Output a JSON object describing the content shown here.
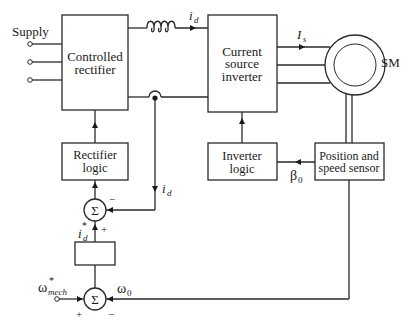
{
  "diagram": {
    "type": "block-diagram",
    "blocks": {
      "controlled_rectifier": {
        "line1": "Controlled",
        "line2": "rectifier"
      },
      "current_source_inverter": {
        "line1": "Current",
        "line2": "source",
        "line3": "inverter"
      },
      "rectifier_logic": {
        "line1": "Rectifier",
        "line2": "logic"
      },
      "inverter_logic": {
        "line1": "Inverter",
        "line2": "logic"
      },
      "position_speed_sensor": {
        "line1": "Position and",
        "line2": "speed sensor"
      },
      "speed_controller": {
        "label": ""
      },
      "motor": {
        "label": "SM"
      }
    },
    "summing_junctions": {
      "current_sum": {
        "symbol": "Σ",
        "plus_sign": "+",
        "minus_sign": "−"
      },
      "speed_sum": {
        "symbol": "Σ",
        "plus_sign": "+",
        "minus_sign": "−"
      }
    },
    "signals": {
      "supply": "Supply",
      "dc_link_current": "i",
      "dc_link_current_sub": "d",
      "feedback_current": "i",
      "feedback_current_sub": "d",
      "current_ref": "i",
      "current_ref_sub": "d",
      "current_ref_sup": "*",
      "stator_current": "I",
      "stator_current_sub": "s",
      "angle_signal": "β",
      "angle_signal_sub": "0",
      "speed_ref": "ω",
      "speed_ref_sub": "mech",
      "speed_ref_sup": "*",
      "speed_feedback": "ω",
      "speed_feedback_sub": "0"
    },
    "colors": {
      "line": "#2a2a2a",
      "text": "#1a1a1a",
      "background": "#ffffff"
    }
  }
}
